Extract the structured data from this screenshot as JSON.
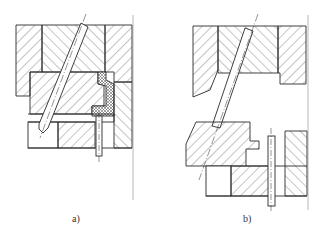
{
  "figures": [
    {
      "id": "a",
      "caption": "a)",
      "description": "Mold section with angled guide pin, closed position, with cross-hatched insert"
    },
    {
      "id": "b",
      "caption": "b)",
      "description": "Mold section with angled guide pin, open position"
    }
  ],
  "colors": {
    "line": "#2a2a2a",
    "hatch": "#555555",
    "background": "#ffffff"
  }
}
